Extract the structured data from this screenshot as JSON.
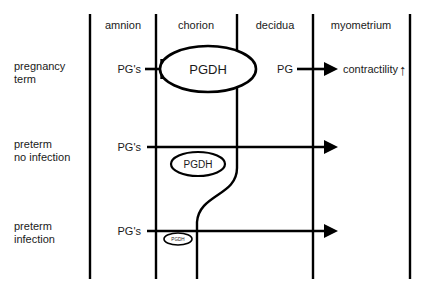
{
  "figure": {
    "line_color": "#000000",
    "background": "#ffffff"
  },
  "columns": [
    {
      "id": "amnion",
      "label": "amnion"
    },
    {
      "id": "chorion",
      "label": "chorion"
    },
    {
      "id": "decidua",
      "label": "decidua"
    },
    {
      "id": "myometrium",
      "label": "myometrium"
    }
  ],
  "rows": [
    {
      "id": "pregnancy-term",
      "label_line1": "pregnancy",
      "label_line2": "term",
      "source_label": "PG's",
      "enzyme_label": "PGDH",
      "enzyme_size": "large",
      "relation": "inhibited",
      "target_source_label": "PG",
      "target_label": "contractility",
      "target_modifier": "up-arrow"
    },
    {
      "id": "preterm-no-infection",
      "label_line1": "preterm",
      "label_line2": "no infection",
      "source_label": "PG's",
      "enzyme_label": "PGDH",
      "enzyme_size": "medium",
      "relation": "passes-through",
      "target_source_label": "",
      "target_label": "",
      "target_modifier": ""
    },
    {
      "id": "preterm-infection",
      "label_line1": "preterm",
      "label_line2": "infection",
      "source_label": "PG's",
      "enzyme_label": "PGDH",
      "enzyme_size": "small",
      "relation": "passes-through",
      "target_source_label": "",
      "target_label": "",
      "target_modifier": ""
    }
  ],
  "annotations": {
    "contractility_arrow_glyph": "↑"
  }
}
